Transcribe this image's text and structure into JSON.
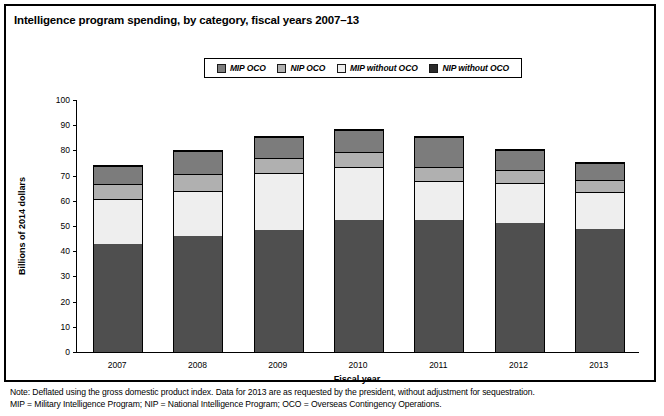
{
  "title": "Intelligence program spending, by category, fiscal years 2007–13",
  "legend": {
    "items": [
      {
        "label": "MIP OCO",
        "color": "#7c7c7c"
      },
      {
        "label": "NIP OCO",
        "color": "#b0b0b0"
      },
      {
        "label": "MIP without OCO",
        "color": "#eeeeee"
      },
      {
        "label": "NIP without OCO",
        "color": "#2b2b2b"
      }
    ]
  },
  "notes": [
    "Note: Deflated using the gross domestic product index. Data for 2013 are as requested by the president, without adjustment for sequestration.",
    "MIP = Military Intelligence Program; NIP = National Intelligence Program; OCO = Overseas Contingency Operations."
  ],
  "chart_data": {
    "type": "bar",
    "subtype": "stacked",
    "title": "Intelligence program spending, by category, fiscal years 2007–13",
    "xlabel": "Fiscal year",
    "ylabel": "Billions of 2014 dollars",
    "categories": [
      "2007",
      "2008",
      "2009",
      "2010",
      "2011",
      "2012",
      "2013"
    ],
    "ylim": [
      0,
      100
    ],
    "yticks": [
      0,
      10,
      20,
      30,
      40,
      50,
      60,
      70,
      80,
      90,
      100
    ],
    "grid": false,
    "legend_position": "top-center",
    "stack_order_bottom_to_top": [
      "NIP without OCO",
      "MIP without OCO",
      "NIP OCO",
      "MIP OCO"
    ],
    "series": [
      {
        "name": "NIP without OCO",
        "color": "#4f4f4f",
        "values": [
          43.0,
          46.0,
          48.5,
          52.5,
          52.5,
          51.0,
          49.0
        ]
      },
      {
        "name": "MIP without OCO",
        "color": "#eeeeee",
        "values": [
          17.5,
          17.5,
          22.0,
          20.5,
          15.0,
          15.5,
          14.0
        ]
      },
      {
        "name": "NIP OCO",
        "color": "#b0b0b0",
        "values": [
          5.5,
          6.5,
          5.5,
          5.5,
          5.0,
          5.0,
          4.5
        ]
      },
      {
        "name": "MIP OCO",
        "color": "#7c7c7c",
        "values": [
          6.5,
          8.5,
          8.0,
          8.5,
          11.5,
          7.5,
          6.5
        ]
      }
    ],
    "totals": [
      72.5,
      78.5,
      84.0,
      87.0,
      84.0,
      79.0,
      74.0
    ]
  }
}
